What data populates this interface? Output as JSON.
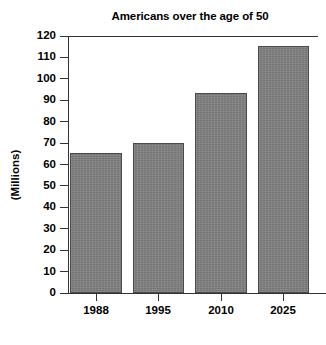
{
  "chart_data": {
    "type": "bar",
    "title": "Americans over the age of 50",
    "xlabel": "",
    "ylabel": "(Millions)",
    "categories": [
      "1988",
      "1995",
      "2010",
      "2025"
    ],
    "values": [
      65.5,
      70,
      93.5,
      115.5
    ],
    "ylim": [
      0,
      120
    ],
    "ytick_labels": [
      "0",
      "10",
      "20",
      "30",
      "40",
      "50",
      "60",
      "70",
      "80",
      "90",
      "100",
      "110",
      "120"
    ],
    "ytick_values": [
      0,
      10,
      20,
      30,
      40,
      50,
      60,
      70,
      80,
      90,
      100,
      110,
      120
    ],
    "grid": false,
    "legend": null,
    "bar_color": "#808080",
    "bar_edge_color": "#4a4a4a",
    "axis_color": "#333333",
    "background_color": "#ffffff",
    "text_color": "#000000"
  }
}
